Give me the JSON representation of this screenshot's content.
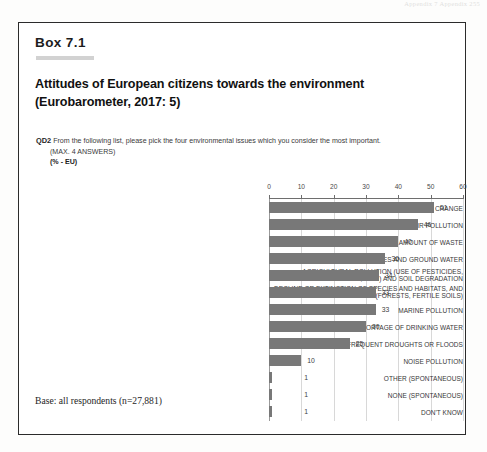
{
  "page": {
    "running_header": "Appendix 7  Appendix   255"
  },
  "box": {
    "label": "Box 7.1",
    "title_line1": "Attitudes of European citizens towards the environment",
    "title_line2": "(Eurobarometer, 2017: 5)",
    "question_code": "QD2",
    "question_text": " From the following list, please pick the four environmental issues which you consider the most important.",
    "question_note": "(MAX. 4 ANSWERS)",
    "question_unit": "(% - EU)",
    "base_note": "Base: all respondents (n=27,881)"
  },
  "chart_data": {
    "type": "bar",
    "orientation": "horizontal",
    "title": "Attitudes of European citizens towards the environment (Eurobarometer, 2017: 5)",
    "xlabel": "",
    "ylabel": "",
    "xlim": [
      0,
      60
    ],
    "xticks": [
      0,
      10,
      20,
      30,
      40,
      50,
      60
    ],
    "grid": true,
    "legend": "none",
    "unit": "% - EU",
    "bar_color": "#787878",
    "categories": [
      "CLIMATE CHANGE",
      "AIR POLLUTION",
      "GROWING AMOUNT OF WASTE",
      "POLLUTION OF RIVERS, LAKES AND GROUND WATER",
      "AGRICULTURAL POLLUTION (USE OF PESTICIDES, FERTILISERS, ETC.) AND SOIL DEGRADATION",
      "DECLINE OR EXTINCTION OF SPECIES AND HABITATS, AND OF NATURAL ECOSYSTEMS (FORESTS, FERTILE SOILS)",
      "MARINE POLLUTION",
      "SHORTAGE OF DRINKING WATER",
      "FREQUENT DROUGHTS OR FLOODS",
      "NOISE POLLUTION",
      "OTHER (SPONTANEOUS)",
      "NONE (SPONTANEOUS)",
      "DON'T KNOW"
    ],
    "category_lines": [
      [
        "CLIMATE CHANGE"
      ],
      [
        "AIR POLLUTION"
      ],
      [
        "GROWING AMOUNT OF WASTE"
      ],
      [
        "POLLUTION OF RIVERS, LAKES AND GROUND WATER"
      ],
      [
        "AGRICULTURAL POLLUTION (USE OF PESTICIDES,",
        "FERTILISERS, ETC.) AND SOIL DEGRADATION"
      ],
      [
        "DECLINE OR EXTINCTION OF SPECIES AND HABITATS, AND",
        "OF NATURAL ECOSYSTEMS (FORESTS, FERTILE SOILS)"
      ],
      [
        "MARINE POLLUTION"
      ],
      [
        "SHORTAGE OF DRINKING WATER"
      ],
      [
        "FREQUENT DROUGHTS OR FLOODS"
      ],
      [
        "NOISE POLLUTION"
      ],
      [
        "OTHER (SPONTANEOUS)"
      ],
      [
        "NONE (SPONTANEOUS)"
      ],
      [
        "DON'T KNOW"
      ]
    ],
    "values": [
      51,
      46,
      40,
      36,
      34,
      33,
      33,
      30,
      25,
      10,
      1,
      1,
      1
    ],
    "value_labels": [
      "51",
      "46",
      "40",
      "36",
      "34",
      "33",
      "33",
      "30",
      "25",
      "10",
      "1",
      "1",
      "1"
    ]
  }
}
